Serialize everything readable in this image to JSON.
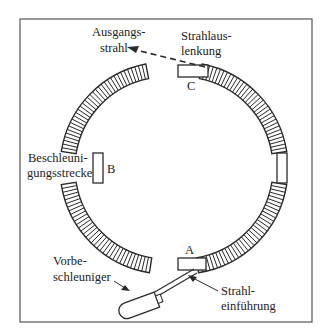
{
  "diagram": {
    "type": "synchrotron-ring-schematic",
    "frame": {
      "x": 20,
      "y": 19,
      "width": 292,
      "height": 303
    },
    "ring": {
      "cx": 166,
      "cy": 168,
      "outer_radius": 106,
      "inner_radius": 92
    },
    "straight_sections": [
      {
        "id": "A",
        "label": "A",
        "position": "bottom"
      },
      {
        "id": "B",
        "label": "B",
        "position": "left"
      },
      {
        "id": "C",
        "label": "C",
        "position": "top"
      },
      {
        "id": "D",
        "label": "",
        "position": "right"
      }
    ],
    "labels": {
      "ausgangsstrahl": [
        "Ausgangs-",
        "strahl"
      ],
      "strahlauslenkung": [
        "Strahlaus-",
        "lenkung"
      ],
      "beschleunigungsstrecke": [
        "Beschleuni-",
        "gungsstrecke"
      ],
      "vorbeschleuniger": [
        "Vorbe-",
        "schleuniger"
      ],
      "strahleinfuehrung": [
        "Strahl-",
        "einführung"
      ]
    },
    "colors": {
      "line": "#2a2a2a",
      "background": "#ffffff"
    }
  }
}
